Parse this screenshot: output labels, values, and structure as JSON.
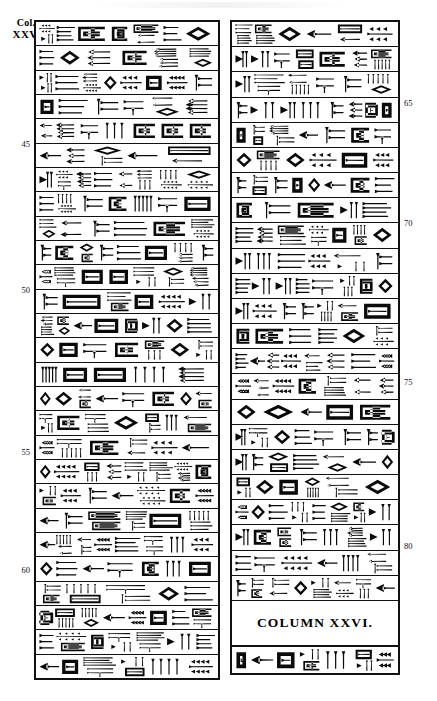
{
  "plate": {
    "column_label": {
      "line1": "Col.",
      "line2": "XXV."
    },
    "caption": "COLUMN XXVI.",
    "ink_color": "#0a0a0a",
    "background_color": "#ffffff"
  },
  "left_panel": {
    "name": "cuneiform-column-xxv",
    "line_numbers": [
      "45",
      "50",
      "55",
      "60"
    ],
    "line_number_positions_px": [
      139,
      285,
      447,
      565
    ],
    "rows": [
      {
        "n": 1,
        "signs": 7,
        "seed": 11
      },
      {
        "n": 2,
        "signs": 6,
        "seed": 23
      },
      {
        "n": 3,
        "signs": 8,
        "seed": 37
      },
      {
        "n": 4,
        "signs": 6,
        "seed": 41
      },
      {
        "n": 5,
        "signs": 7,
        "seed": 53
      },
      {
        "n": 6,
        "signs": 5,
        "seed": 67
      },
      {
        "n": 7,
        "signs": 8,
        "seed": 71
      },
      {
        "n": 8,
        "signs": 7,
        "seed": 83
      },
      {
        "n": 9,
        "signs": 6,
        "seed": 97
      },
      {
        "n": 10,
        "signs": 8,
        "seed": 103
      },
      {
        "n": 11,
        "signs": 7,
        "seed": 109
      },
      {
        "n": 12,
        "signs": 6,
        "seed": 127
      },
      {
        "n": 13,
        "signs": 8,
        "seed": 131
      },
      {
        "n": 14,
        "signs": 7,
        "seed": 149
      },
      {
        "n": 15,
        "signs": 5,
        "seed": 151
      },
      {
        "n": 16,
        "signs": 8,
        "seed": 163
      },
      {
        "n": 17,
        "signs": 7,
        "seed": 173
      },
      {
        "n": 18,
        "signs": 6,
        "seed": 181
      },
      {
        "n": 19,
        "signs": 8,
        "seed": 191
      },
      {
        "n": 20,
        "signs": 7,
        "seed": 199
      },
      {
        "n": 21,
        "signs": 6,
        "seed": 211
      },
      {
        "n": 22,
        "signs": 8,
        "seed": 223
      },
      {
        "n": 23,
        "signs": 7,
        "seed": 227
      },
      {
        "n": 24,
        "signs": 5,
        "seed": 233
      },
      {
        "n": 25,
        "signs": 8,
        "seed": 239
      },
      {
        "n": 26,
        "signs": 7,
        "seed": 251
      },
      {
        "n": 27,
        "signs": 6,
        "seed": 257
      }
    ]
  },
  "right_panel": {
    "name": "cuneiform-column-xxvi",
    "line_numbers": [
      "65",
      "70",
      "75",
      "80"
    ],
    "line_number_positions_px": [
      98,
      218,
      377,
      541
    ],
    "rows": [
      {
        "n": 1,
        "signs": 6,
        "seed": 13
      },
      {
        "n": 2,
        "signs": 7,
        "seed": 29
      },
      {
        "n": 3,
        "signs": 6,
        "seed": 43
      },
      {
        "n": 4,
        "signs": 8,
        "seed": 59
      },
      {
        "n": 5,
        "signs": 7,
        "seed": 73
      },
      {
        "n": 6,
        "signs": 6,
        "seed": 89
      },
      {
        "n": 7,
        "signs": 8,
        "seed": 101
      },
      {
        "n": 8,
        "signs": 5,
        "seed": 113
      },
      {
        "n": 9,
        "signs": 7,
        "seed": 137
      },
      {
        "n": 10,
        "signs": 6,
        "seed": 139
      },
      {
        "n": 11,
        "signs": 8,
        "seed": 157
      },
      {
        "n": 12,
        "signs": 7,
        "seed": 167
      },
      {
        "n": 13,
        "signs": 6,
        "seed": 179
      },
      {
        "n": 14,
        "signs": 8,
        "seed": 193
      },
      {
        "n": 15,
        "signs": 7,
        "seed": 197
      },
      {
        "n": 16,
        "signs": 5,
        "seed": 229
      },
      {
        "n": 17,
        "signs": 8,
        "seed": 241
      },
      {
        "n": 18,
        "signs": 7,
        "seed": 263
      },
      {
        "n": 19,
        "signs": 6,
        "seed": 269
      },
      {
        "n": 20,
        "signs": 8,
        "seed": 271
      },
      {
        "n": 21,
        "signs": 7,
        "seed": 277
      },
      {
        "n": 22,
        "signs": 6,
        "seed": 281
      },
      {
        "n": 23,
        "signs": 8,
        "seed": 283
      }
    ],
    "footer_row": {
      "n": 24,
      "signs": 7,
      "seed": 293
    }
  }
}
